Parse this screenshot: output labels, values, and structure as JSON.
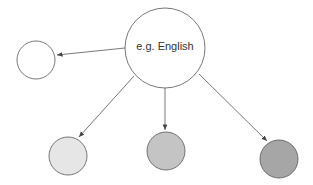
{
  "diagram": {
    "root": {
      "label": "e.g. English",
      "fill": "#ffffff"
    },
    "children": [
      {
        "name": "left-node",
        "fill": "#ffffff"
      },
      {
        "name": "bottom-node-1",
        "fill": "#e6e6e6"
      },
      {
        "name": "bottom-node-2",
        "fill": "#c4c4c4"
      },
      {
        "name": "bottom-node-3",
        "fill": "#a6a6a6"
      }
    ],
    "stroke": "#555555"
  }
}
